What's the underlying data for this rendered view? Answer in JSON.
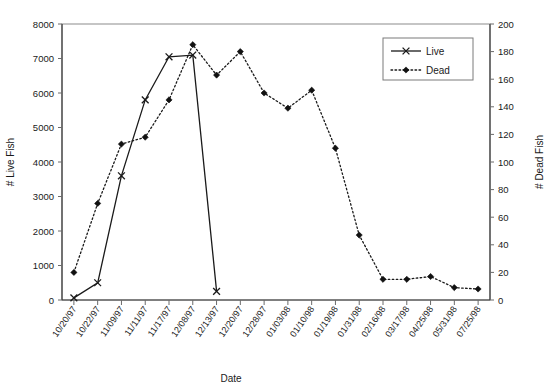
{
  "chart_data": {
    "type": "line",
    "title": "",
    "xlabel": "Date",
    "ylabel": "# Live Fish",
    "y2label": "# Dead Fish",
    "grid": false,
    "legend_position": "top-right",
    "ylim": [
      0,
      8000
    ],
    "y2lim": [
      0,
      200
    ],
    "yticks": [
      0,
      1000,
      2000,
      3000,
      4000,
      5000,
      6000,
      7000,
      8000
    ],
    "y2ticks": [
      0,
      20,
      40,
      60,
      80,
      100,
      120,
      140,
      160,
      180,
      200
    ],
    "categories": [
      "10/20/97",
      "10/22/97",
      "11/09/97",
      "11/11/97",
      "11/17/97",
      "12/08/97",
      "12/13/97",
      "12/20/97",
      "12/28/97",
      "01/03/98",
      "01/10/98",
      "01/19/98",
      "01/31/98",
      "02/16/98",
      "03/17/98",
      "04/25/98",
      "05/31/98",
      "07/25/98"
    ],
    "series": [
      {
        "name": "Live",
        "axis": "left",
        "marker": "x",
        "line": "solid",
        "values": [
          60,
          500,
          3600,
          5800,
          7050,
          7100,
          250,
          null,
          null,
          null,
          null,
          null,
          null,
          null,
          null,
          null,
          null,
          null
        ]
      },
      {
        "name": "Dead",
        "axis": "right",
        "marker": "diamond",
        "line": "dotted",
        "values": [
          20,
          70,
          113,
          118,
          145,
          185,
          163,
          180,
          150,
          139,
          152,
          110,
          47,
          15,
          15,
          17,
          9,
          8
        ]
      }
    ]
  },
  "legend": {
    "entries": [
      {
        "label": "Live",
        "marker": "x",
        "line": "solid"
      },
      {
        "label": "Dead",
        "marker": "diamond",
        "line": "dotted"
      }
    ]
  },
  "axes": {
    "left_title": "# Live Fish",
    "right_title": "# Dead Fish",
    "bottom_title": "Date"
  }
}
